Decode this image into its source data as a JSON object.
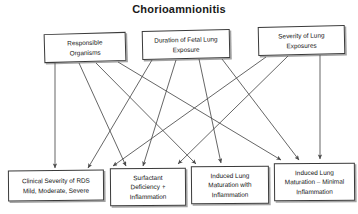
{
  "title": "Chorioamnionitis",
  "diagram": {
    "type": "flow-diagram",
    "orientation": "top-down",
    "top_nodes": [
      {
        "id": "responsible-organisms",
        "label": "Responsible Organisms",
        "line1": "Responsible",
        "line2": "Organisms"
      },
      {
        "id": "duration-fetal-lung-exposure",
        "label": "Duration of Fetal Lung Exposure",
        "line1": "Duration of Fetal Lung",
        "line2": "Exposure"
      },
      {
        "id": "severity-lung-exposures",
        "label": "Severity of Lung Exposures",
        "line1": "Severity of Lung",
        "line2": "Exposures"
      }
    ],
    "bottom_nodes": [
      {
        "id": "clinical-severity-rds",
        "label": "Clinical Severity of RDS Mild, Moderate, Severe",
        "line1": "Clinical Severity of RDS",
        "line2": "Mild, Moderate, Severe",
        "line3": ""
      },
      {
        "id": "surfactant-deficiency-inflammation",
        "label": "Surfactant Deficiency + Inflammation",
        "line1": "Surfactant",
        "line2": "Deficiency +",
        "line3": "Inflammation"
      },
      {
        "id": "induced-lung-maturation-with-inflammation",
        "label": "Induced Lung Maturation with Inflammation",
        "line1": "Induced Lung",
        "line2": "Maturation with",
        "line3": "Inflammation"
      },
      {
        "id": "induced-lung-maturation-minimal-inflammation",
        "label": "Induced Lung Maturation – Minimal Inflammation",
        "line1": "Induced Lung",
        "line2": "Maturation – Minimal",
        "line3": "Inflammation"
      }
    ],
    "edges": [
      {
        "from": "responsible-organisms",
        "to": "clinical-severity-rds"
      },
      {
        "from": "responsible-organisms",
        "to": "surfactant-deficiency-inflammation"
      },
      {
        "from": "responsible-organisms",
        "to": "induced-lung-maturation-with-inflammation"
      },
      {
        "from": "responsible-organisms",
        "to": "induced-lung-maturation-minimal-inflammation"
      },
      {
        "from": "duration-fetal-lung-exposure",
        "to": "clinical-severity-rds"
      },
      {
        "from": "duration-fetal-lung-exposure",
        "to": "surfactant-deficiency-inflammation"
      },
      {
        "from": "duration-fetal-lung-exposure",
        "to": "induced-lung-maturation-with-inflammation"
      },
      {
        "from": "duration-fetal-lung-exposure",
        "to": "induced-lung-maturation-minimal-inflammation"
      },
      {
        "from": "severity-lung-exposures",
        "to": "surfactant-deficiency-inflammation"
      },
      {
        "from": "severity-lung-exposures",
        "to": "induced-lung-maturation-with-inflammation"
      },
      {
        "from": "severity-lung-exposures",
        "to": "induced-lung-maturation-minimal-inflammation"
      }
    ],
    "colors": {
      "background": "#ffffff",
      "box_border": "#3a3a3a",
      "text": "#141414",
      "arrow": "#4a4a4a"
    }
  }
}
